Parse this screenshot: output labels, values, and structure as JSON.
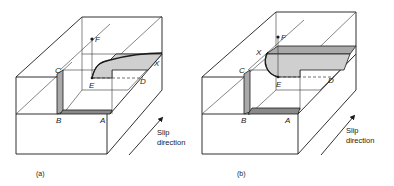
{
  "figure": {
    "panels": [
      {
        "id": "a",
        "caption": "(a)",
        "points": {
          "C": "C",
          "B": "B",
          "A": "A",
          "E": "E",
          "F": "F",
          "D": "D",
          "X": "X"
        },
        "slip_label_line1": "Slip",
        "slip_label_line2": "direction"
      },
      {
        "id": "b",
        "caption": "(b)",
        "points": {
          "C": "C",
          "B": "B",
          "A": "A",
          "E": "E",
          "F": "F",
          "D": "D",
          "X": "X"
        },
        "slip_label_line1": "Slip",
        "slip_label_line2": "direction"
      }
    ]
  }
}
